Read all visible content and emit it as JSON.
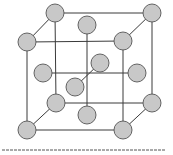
{
  "diagram": {
    "title": "",
    "type": "face-centered-cubic-lattice",
    "colors": {
      "background": "#ffffff",
      "edge": "#3a3a3a",
      "atom_fill": "#c8c8c8",
      "atom_stroke": "#555555",
      "baseline": "#555555"
    },
    "atom_radius": 9,
    "atoms": [
      {
        "id": "back-top-left",
        "x": 55,
        "y": 13
      },
      {
        "id": "back-top-right",
        "x": 152,
        "y": 13
      },
      {
        "id": "back-bottom-left",
        "x": 56,
        "y": 103
      },
      {
        "id": "back-bottom-right",
        "x": 152,
        "y": 103
      },
      {
        "id": "top-face-center",
        "x": 87,
        "y": 25
      },
      {
        "id": "back-face-center",
        "x": 100,
        "y": 63
      },
      {
        "id": "left-face-center",
        "x": 43,
        "y": 73
      },
      {
        "id": "right-face-center",
        "x": 137,
        "y": 73
      },
      {
        "id": "bottom-face-center",
        "x": 87,
        "y": 115
      },
      {
        "id": "front-face-center",
        "x": 75,
        "y": 87
      },
      {
        "id": "front-top-left",
        "x": 27,
        "y": 42
      },
      {
        "id": "front-top-right",
        "x": 123,
        "y": 41
      },
      {
        "id": "front-bottom-left",
        "x": 27,
        "y": 130
      },
      {
        "id": "front-bottom-right",
        "x": 123,
        "y": 130
      }
    ],
    "edges": [
      {
        "x1": 55,
        "y1": 13,
        "x2": 152,
        "y2": 13
      },
      {
        "x1": 152,
        "y1": 13,
        "x2": 152,
        "y2": 103
      },
      {
        "x1": 55,
        "y1": 13,
        "x2": 56,
        "y2": 103
      },
      {
        "x1": 56,
        "y1": 103,
        "x2": 152,
        "y2": 103
      },
      {
        "x1": 27,
        "y1": 42,
        "x2": 123,
        "y2": 41
      },
      {
        "x1": 123,
        "y1": 41,
        "x2": 123,
        "y2": 130
      },
      {
        "x1": 27,
        "y1": 42,
        "x2": 27,
        "y2": 130
      },
      {
        "x1": 27,
        "y1": 130,
        "x2": 123,
        "y2": 130
      },
      {
        "x1": 27,
        "y1": 42,
        "x2": 55,
        "y2": 13
      },
      {
        "x1": 123,
        "y1": 41,
        "x2": 152,
        "y2": 13
      },
      {
        "x1": 27,
        "y1": 130,
        "x2": 56,
        "y2": 103
      },
      {
        "x1": 123,
        "y1": 130,
        "x2": 152,
        "y2": 103
      },
      {
        "x1": 87,
        "y1": 25,
        "x2": 87,
        "y2": 115
      },
      {
        "x1": 43,
        "y1": 73,
        "x2": 137,
        "y2": 73
      },
      {
        "x1": 75,
        "y1": 87,
        "x2": 100,
        "y2": 63
      }
    ],
    "baseline": {
      "x1": 2,
      "y1": 150,
      "x2": 166,
      "y2": 150,
      "dash": "3,1"
    }
  }
}
